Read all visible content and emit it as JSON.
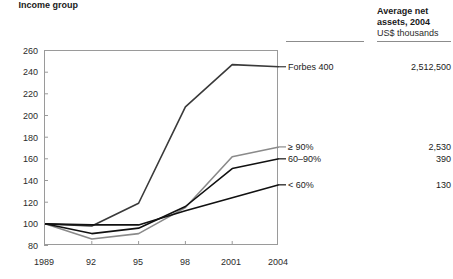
{
  "header": {
    "income_group_label": "Income group",
    "assets_label": "Average net assets, 2004",
    "assets_unit": "US$ thousands"
  },
  "chart_data": {
    "type": "line",
    "title": "",
    "xlabel": "",
    "ylabel": "",
    "x": [
      "1989",
      "92",
      "95",
      "98",
      "2001",
      "2004"
    ],
    "xtick_labels": [
      "1989",
      "92",
      "95",
      "98",
      "2001",
      "2004"
    ],
    "ytick_labels": [
      "80",
      "100",
      "120",
      "140",
      "160",
      "180",
      "200",
      "220",
      "240",
      "260"
    ],
    "ylim": [
      80,
      260
    ],
    "ytick_step": 20,
    "grid": false,
    "legend_position": "right-inline",
    "series": [
      {
        "name": "Forbes 400",
        "color": "#3a3a3a",
        "values": [
          100,
          98,
          119,
          208,
          247,
          245
        ],
        "net_assets_2004": "2,512,500"
      },
      {
        "name": "≥ 90%",
        "color": "#8a8a8a",
        "values": [
          100,
          86,
          91,
          115,
          162,
          171
        ],
        "net_assets_2004": "2,530"
      },
      {
        "name": "60–90%",
        "color": "#111111",
        "values": [
          100,
          91,
          96,
          116,
          151,
          160
        ],
        "net_assets_2004": "390"
      },
      {
        "name": "< 60%",
        "color": "#111111",
        "values": [
          100,
          99,
          99,
          112,
          124,
          136
        ],
        "net_assets_2004": "130"
      }
    ]
  },
  "annotations": {
    "forbes_label": "Forbes 400",
    "forbes_value": "2,512,500",
    "top10_label": "≥ 90%",
    "top10_value": "2,530",
    "mid_label": "60–90%",
    "mid_value": "390",
    "low_label": "< 60%",
    "low_value": "130"
  },
  "colors": {
    "axis": "#9a9a9a",
    "text": "#1a1a1a",
    "gray_series": "#8a8a8a",
    "dark_series": "#111111"
  }
}
